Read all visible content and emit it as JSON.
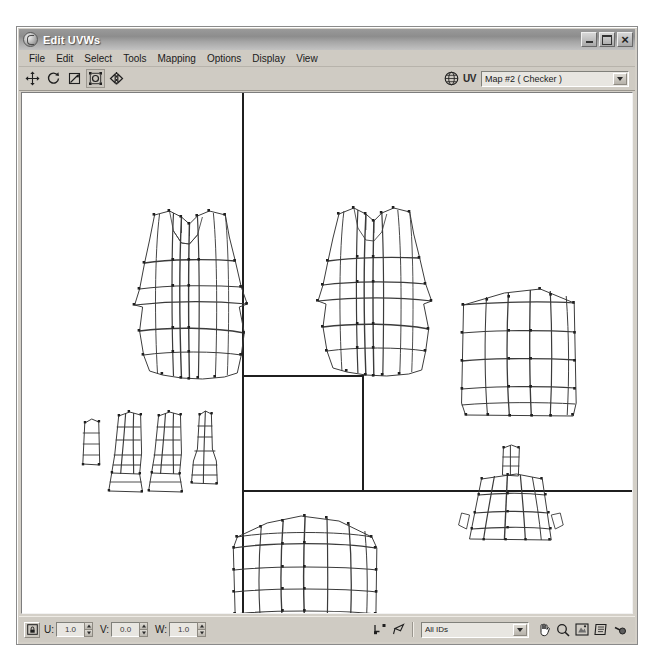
{
  "window": {
    "title": "Edit UVWs",
    "app_icon": "max-logo-icon",
    "controls": [
      {
        "name": "minimize-button",
        "icon": "minimize-icon",
        "label": "_"
      },
      {
        "name": "maximize-button",
        "icon": "maximize-icon",
        "label": "□"
      },
      {
        "name": "close-button",
        "icon": "close-icon",
        "label": "×"
      }
    ]
  },
  "menubar": {
    "items": [
      {
        "label": "File"
      },
      {
        "label": "Edit"
      },
      {
        "label": "Select"
      },
      {
        "label": "Tools"
      },
      {
        "label": "Mapping"
      },
      {
        "label": "Options"
      },
      {
        "label": "Display"
      },
      {
        "label": "View"
      }
    ]
  },
  "toolbar": {
    "tools": [
      {
        "name": "move-tool",
        "icon": "move-arrows-icon",
        "tip": "Move"
      },
      {
        "name": "rotate-tool",
        "icon": "rotate-circular-arrow-icon",
        "tip": "Rotate"
      },
      {
        "name": "scale-tool",
        "icon": "scale-corner-icon",
        "tip": "Scale"
      },
      {
        "name": "freeform-tool",
        "icon": "freeform-gizmo-icon",
        "tip": "Freeform Mode"
      },
      {
        "name": "mirror-tool",
        "icon": "mirror-horizontal-icon",
        "tip": "Mirror Horizontal"
      }
    ],
    "map_display": {
      "globe_icon": "show-map-globe-icon",
      "uv_label": "UV",
      "selected_map": "Map #2 ( Checker )",
      "options": [
        "Map #2 ( Checker )"
      ]
    }
  },
  "statusbar": {
    "lock_button": {
      "name": "lock-selected-vertices-button",
      "icon": "lock-icon"
    },
    "coords": [
      {
        "label": "U:",
        "value": "1.0"
      },
      {
        "label": "V:",
        "value": "0.0"
      },
      {
        "label": "W:",
        "value": "1.0"
      }
    ],
    "tools": [
      {
        "name": "weld-selected-button",
        "icon": "weld-vertices-icon"
      },
      {
        "name": "target-weld-button",
        "icon": "target-weld-icon"
      }
    ],
    "id_filter": {
      "selected": "All IDs",
      "options": [
        "All IDs"
      ]
    },
    "nav_tools": [
      {
        "name": "pan-tool",
        "icon": "pan-hand-icon"
      },
      {
        "name": "zoom-tool",
        "icon": "zoom-magnifier-icon"
      },
      {
        "name": "zoom-region-tool",
        "icon": "zoom-region-icon"
      },
      {
        "name": "zoom-extents-tool",
        "icon": "zoom-extents-icon"
      },
      {
        "name": "snap-toggle",
        "icon": "snap-icon"
      }
    ]
  },
  "canvas": {
    "background": "#ffffff",
    "line_color": "#3a3a3a",
    "guide_color": "#222222",
    "guides": {
      "vertical_line_x": 222,
      "horizontal_line_y": 398,
      "uv_square": {
        "x": 222,
        "y": 283,
        "w": 120,
        "h": 115
      }
    },
    "shells": [
      {
        "name": "vest-front-panel",
        "type": "garment-torso",
        "cx": 193,
        "cy": 158
      },
      {
        "name": "vest-back-panel",
        "type": "garment-torso",
        "cx": 367,
        "cy": 155
      },
      {
        "name": "side-panel-rect",
        "type": "grid-rect",
        "cx": 514,
        "cy": 250
      },
      {
        "name": "trim-strips-cluster",
        "type": "narrow-strips",
        "cx": 146,
        "cy": 348
      },
      {
        "name": "bottom-panel-rect",
        "type": "grid-rect",
        "cx": 288,
        "cy": 482
      },
      {
        "name": "collar-piece",
        "type": "trapezoid-tab",
        "cx": 488,
        "cy": 412
      }
    ]
  }
}
